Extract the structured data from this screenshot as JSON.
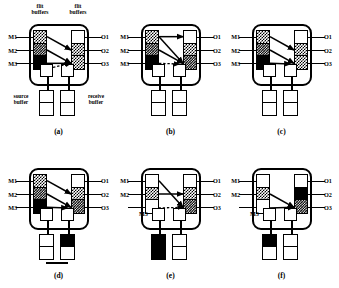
{
  "figure": {
    "colors": {
      "ink": "#000000",
      "paper": "#ffffff"
    },
    "header_labels": {
      "left": "flit\nbuffers",
      "right": "flit\nbuffers"
    },
    "bottom_labels": {
      "left": "source\nbuffer",
      "right": "receive\nbuffer"
    },
    "input_ports": [
      "M1",
      "M2",
      "M3"
    ],
    "output_ports": [
      "O1",
      "O2",
      "O3"
    ],
    "m3_moved_label": "M3"
  },
  "panels": [
    {
      "id": "a",
      "caption": "(a)",
      "show_header_labels": true,
      "show_bottom_labels": true,
      "input_labels": [
        "M1",
        "M2",
        "M3"
      ],
      "output_labels": [
        "O1",
        "O2",
        "O3"
      ],
      "left_buffer": [
        "check",
        "dark",
        "black"
      ],
      "right_buffer": [
        "white",
        "check",
        "check"
      ],
      "inner_source": "white",
      "inner_receive": "white",
      "outer_source": [
        "white",
        "white"
      ],
      "outer_receive": [
        "white",
        "white"
      ],
      "base_link": false,
      "m3_relabelled": false,
      "arrows": [
        {
          "kind": "solid",
          "from": "M1",
          "to": "O2"
        },
        {
          "kind": "solid",
          "from": "M2",
          "to": "O3"
        },
        {
          "kind": "solid",
          "from": "M3",
          "to": "O3"
        },
        {
          "kind": "dashed",
          "from": "inner",
          "to": "O3"
        }
      ]
    },
    {
      "id": "b",
      "caption": "(b)",
      "show_header_labels": false,
      "show_bottom_labels": false,
      "input_labels": [
        "M1",
        "M2",
        "M3"
      ],
      "output_labels": [
        "O1",
        "O2",
        "O3"
      ],
      "left_buffer": [
        "check",
        "dark",
        "black"
      ],
      "right_buffer": [
        "white",
        "check",
        "dark"
      ],
      "inner_source": "white",
      "inner_receive": "white",
      "outer_source": [
        "white",
        "white"
      ],
      "outer_receive": [
        "white",
        "white"
      ],
      "base_link": false,
      "m3_relabelled": false,
      "arrows": [
        {
          "kind": "solid",
          "from": "M1",
          "to": "O1"
        },
        {
          "kind": "solid",
          "from": "M1",
          "to": "O3"
        },
        {
          "kind": "solid",
          "from": "M2",
          "to": "O3"
        },
        {
          "kind": "dashed",
          "from": "M3",
          "to": "receive"
        }
      ]
    },
    {
      "id": "c",
      "caption": "(c)",
      "show_header_labels": false,
      "show_bottom_labels": false,
      "input_labels": [
        "M1",
        "M2",
        "M3"
      ],
      "output_labels": [
        "O1",
        "O2",
        "O3"
      ],
      "left_buffer": [
        "check",
        "dark",
        "black"
      ],
      "right_buffer": [
        "white",
        "check",
        "check"
      ],
      "inner_source": "white",
      "inner_receive": "black",
      "outer_source": [
        "white",
        "white"
      ],
      "outer_receive": [
        "white",
        "white"
      ],
      "base_link": false,
      "m3_relabelled": false,
      "arrows": [
        {
          "kind": "solid",
          "from": "M1",
          "to": "O2"
        },
        {
          "kind": "solid",
          "from": "M2",
          "to": "O3"
        },
        {
          "kind": "solid",
          "from": "M3",
          "to": "receive"
        }
      ]
    },
    {
      "id": "d",
      "caption": "(d)",
      "show_header_labels": false,
      "show_bottom_labels": false,
      "input_labels": [
        "M1",
        "M2",
        "M3"
      ],
      "output_labels": [
        "O1",
        "O2",
        "O3"
      ],
      "left_buffer": [
        "check",
        "dark",
        "black"
      ],
      "right_buffer": [
        "white",
        "check",
        "dark"
      ],
      "inner_source": "white",
      "inner_receive": "black",
      "outer_source": [
        "white",
        "white"
      ],
      "outer_receive": [
        "black",
        "white"
      ],
      "base_link": true,
      "m3_relabelled": false,
      "arrows": [
        {
          "kind": "solid",
          "from": "M1",
          "to": "O2"
        },
        {
          "kind": "solid",
          "from": "M2",
          "to": "O3"
        },
        {
          "kind": "solid",
          "from": "M3",
          "to": "receive"
        }
      ]
    },
    {
      "id": "e",
      "caption": "(e)",
      "show_header_labels": false,
      "show_bottom_labels": false,
      "input_labels": [
        "M1",
        "M2",
        ""
      ],
      "output_labels": [
        "O1",
        "O2",
        "O3"
      ],
      "left_buffer": [
        "white",
        "check",
        "white"
      ],
      "right_buffer": [
        "white",
        "check",
        "dark"
      ],
      "inner_source": "black",
      "inner_receive": "white",
      "outer_source": [
        "black",
        "black"
      ],
      "outer_receive": [
        "white",
        "white"
      ],
      "base_link": false,
      "m3_relabelled": true,
      "arrows": [
        {
          "kind": "solid",
          "from": "M1",
          "to": "O3"
        },
        {
          "kind": "solid",
          "from": "M2",
          "to": "O2"
        },
        {
          "kind": "dashed",
          "from": "source",
          "to": "O3"
        }
      ]
    },
    {
      "id": "f",
      "caption": "(f)",
      "show_header_labels": false,
      "show_bottom_labels": false,
      "input_labels": [
        "M1",
        "M2",
        ""
      ],
      "output_labels": [
        "O1",
        "O2",
        "O3"
      ],
      "left_buffer": [
        "white",
        "check",
        "white"
      ],
      "right_buffer": [
        "white",
        "black",
        "dark"
      ],
      "inner_source": "black",
      "inner_receive": "white",
      "outer_source": [
        "black",
        "white"
      ],
      "outer_receive": [
        "white",
        "white"
      ],
      "base_link": false,
      "m3_relabelled": true,
      "arrows": [
        {
          "kind": "solid",
          "from": "M2",
          "to": "O3"
        },
        {
          "kind": "solid",
          "from": "source",
          "to": "O3"
        }
      ]
    }
  ]
}
